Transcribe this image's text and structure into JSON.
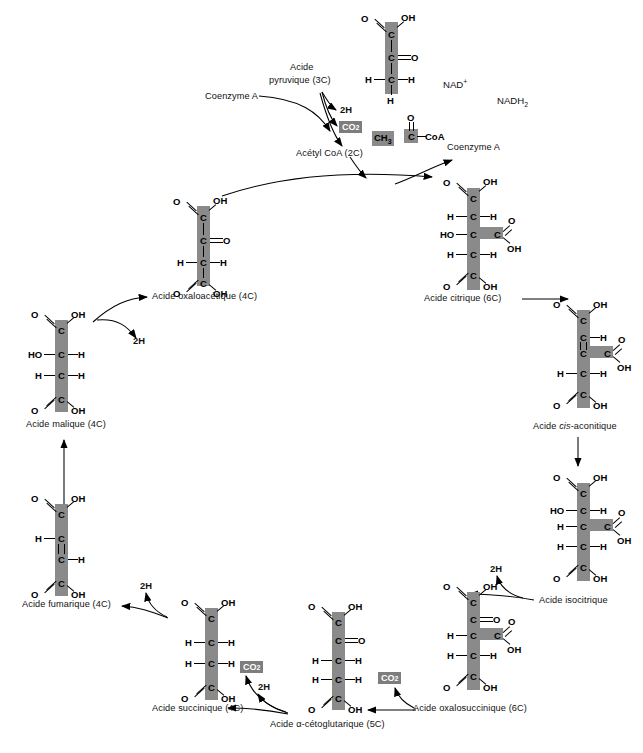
{
  "diagram": {
    "language": "fr",
    "spine_color": "#8a8a8a",
    "highlight_color": "#7d7d7d",
    "background": "#ffffff"
  },
  "cofactors": {
    "nad_plus": "NAD",
    "nad_plus_sup": "+",
    "nadh2": "NADH",
    "nadh2_sub": "2",
    "coenzyme_a_left": "Coenzyme A",
    "coenzyme_a_right": "Coenzyme A"
  },
  "byproducts": {
    "two_h_1": "2H",
    "two_h_2": "2H",
    "two_h_3": "2H",
    "two_h_4": "2H",
    "co2_label": "CO",
    "co2_sub": "2"
  },
  "labels": {
    "pyruvic_l1": "Acide",
    "pyruvic_l2": "pyruvique (3C)",
    "acetyl_coa": "Acétyl CoA (2C)",
    "acetyl_coa_formula_ch3": "CH",
    "acetyl_coa_formula_ch3_sub": "3",
    "acetyl_coa_formula_coa": "CoA",
    "oxaloacetic": "Acide oxaloacétique (4C)",
    "citric": "Acide citrique (6C)",
    "cis_aconitic_pre": "Acide ",
    "cis_aconitic_italic": "cis",
    "cis_aconitic_post": "-aconitique",
    "isocitric": "Acide isocitrique",
    "oxalosuccinic": "Acide oxalosuccinique (6C)",
    "alpha_ketoglutaric": "Acide α-cétoglutarique (5C)",
    "succinic": "Acide succinique (4C)",
    "fumaric": "Acide fumarique (4C)",
    "malic": "Acide malique (4C)"
  },
  "molecules": {
    "pyruvic": {
      "name": "Acide pyruvique",
      "carbons": 3,
      "rows": [
        "O=C-OH",
        "C=O",
        "H-C-H",
        "H"
      ]
    },
    "acetyl_coa": {
      "name": "Acétyl CoA",
      "carbons": 2,
      "rows": [
        "O",
        "CH3-C-CoA"
      ]
    },
    "oxaloacetic": {
      "name": "Acide oxaloacétique",
      "carbons": 4,
      "rows": [
        "O=C-OH",
        "C=O",
        "H-C-H",
        "O=C-OH"
      ]
    },
    "citric": {
      "name": "Acide citrique",
      "carbons": 6,
      "rows": [
        "O=C-OH",
        "H-C-H",
        "HO-C-C(=O)OH",
        "H-C-H",
        "O=C-OH"
      ]
    },
    "cis_aconitic": {
      "name": "Acide cis-aconitique",
      "carbons": 6,
      "rows": [
        "O=C-OH",
        "C-H",
        "C-C(=O)OH",
        "H-C-H",
        "O=C-OH"
      ]
    },
    "isocitric": {
      "name": "Acide isocitrique",
      "carbons": 6,
      "rows": [
        "O=C-OH",
        "HO-C-H",
        "H-C-C(=O)OH",
        "H-C-H",
        "O=C-OH"
      ]
    },
    "oxalosuccinic": {
      "name": "Acide oxalosuccinique",
      "carbons": 6,
      "rows": [
        "O=C-OH",
        "C=O",
        "H-C-C(=O)OH",
        "H-C-H",
        "O=C-OH"
      ]
    },
    "alpha_ketoglutaric": {
      "name": "Acide α-cétoglutarique",
      "carbons": 5,
      "rows": [
        "O=C-OH",
        "C=O",
        "H-C-H",
        "H-C-H",
        "O=C-OH"
      ]
    },
    "succinic": {
      "name": "Acide succinique",
      "carbons": 4,
      "rows": [
        "O=C-OH",
        "H-C-H",
        "H-C-H",
        "O=C-OH"
      ]
    },
    "fumaric": {
      "name": "Acide fumarique",
      "carbons": 4,
      "rows": [
        "O=C-OH",
        "H-C",
        "C-H",
        "O=C-OH"
      ]
    },
    "malic": {
      "name": "Acide malique",
      "carbons": 4,
      "rows": [
        "O=C-OH",
        "HO-C-H",
        "H-C-H",
        "O=C-OH"
      ]
    }
  },
  "atoms": {
    "C": "C",
    "H": "H",
    "O": "O",
    "OH": "OH",
    "HO": "HO",
    "CoA": "CoA"
  }
}
